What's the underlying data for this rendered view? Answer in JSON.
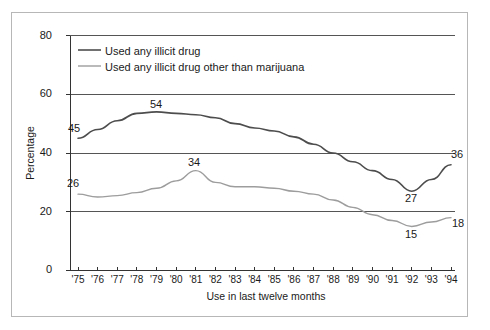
{
  "chart_data": {
    "type": "line",
    "title": "",
    "xlabel": "Use in last twelve months",
    "ylabel": "Percentage",
    "ylim": [
      0,
      80
    ],
    "yticks": [
      0,
      20,
      40,
      60,
      80
    ],
    "grid": true,
    "legend_position": "top-left-inside",
    "x": [
      "'75",
      "'76",
      "'77",
      "'78",
      "'79",
      "'80",
      "'81",
      "'82",
      "'83",
      "'84",
      "'85",
      "'86",
      "'87",
      "'88",
      "'89",
      "'90",
      "'91",
      "'92",
      "'93",
      "'94"
    ],
    "series": [
      {
        "name": "Used any illicit drug",
        "color": "#4d4d4d",
        "values": [
          45,
          48,
          51,
          53.5,
          54,
          53.5,
          53,
          52,
          50,
          48.5,
          47.5,
          45.5,
          43,
          40,
          37,
          34,
          31,
          27,
          31,
          36
        ],
        "point_labels": [
          {
            "x": "'75",
            "value": 45,
            "text": "45"
          },
          {
            "x": "'79",
            "value": 54,
            "text": "54"
          },
          {
            "x": "'92",
            "value": 27,
            "text": "27"
          },
          {
            "x": "'94",
            "value": 36,
            "text": "36"
          }
        ]
      },
      {
        "name": "Used any illicit drug other than marijuana",
        "color": "#9d9d9d",
        "values": [
          26,
          25,
          25.5,
          26.5,
          28,
          30.5,
          34,
          30,
          28.5,
          28.5,
          28,
          27,
          26,
          24,
          21.5,
          19,
          17,
          15,
          16.5,
          18
        ],
        "point_labels": [
          {
            "x": "'75",
            "value": 26,
            "text": "26"
          },
          {
            "x": "'81",
            "value": 34,
            "text": "34"
          },
          {
            "x": "'92",
            "value": 15,
            "text": "15"
          },
          {
            "x": "'94",
            "value": 18,
            "text": "18"
          }
        ]
      }
    ],
    "legend": [
      {
        "label": "Used any illicit drug",
        "color": "#4d4d4d"
      },
      {
        "label": "Used any illicit drug other than marijuana",
        "color": "#9d9d9d"
      }
    ]
  },
  "axis": {
    "y_tick_labels": [
      "80",
      "60",
      "40",
      "20",
      "0"
    ],
    "x_tick_labels": [
      "'75",
      "'76",
      "'77",
      "'78",
      "'79",
      "'80",
      "'81",
      "'82",
      "'83",
      "'84",
      "'85",
      "'86",
      "'87",
      "'88",
      "'89",
      "'90",
      "'91",
      "'92",
      "'93",
      "'94"
    ],
    "y_title": "Percentage",
    "x_title": "Use in last twelve months"
  },
  "labels": {
    "dark_start": "45",
    "dark_peak": "54",
    "dark_trough": "27",
    "dark_end": "36",
    "light_start": "26",
    "light_peak": "34",
    "light_trough": "15",
    "light_end": "18"
  },
  "legend": {
    "item1": "Used any illicit drug",
    "item2": "Used any illicit drug other than marijuana"
  }
}
